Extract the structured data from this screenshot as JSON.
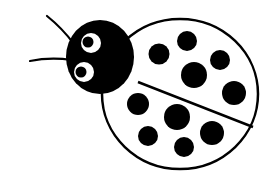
{
  "illustration": {
    "subject": "ladybug",
    "style": "black-and-white clip art",
    "colors": {
      "background": "#ffffff",
      "ink": "#000000",
      "shell_fill": "#ffffff",
      "eye_white": "#ffffff"
    },
    "shell": {
      "cx": 180,
      "cy": 94,
      "rx": 78,
      "ry": 75,
      "stroke_width": 2.5
    },
    "divider": {
      "x1": 138,
      "y1": 82,
      "x2": 253,
      "y2": 127
    },
    "head": {
      "cx": 100,
      "cy": 57,
      "rx": 34,
      "ry": 37
    },
    "eyes": [
      {
        "cx": 91,
        "cy": 43,
        "r": 10,
        "pupil_cx": 88,
        "pupil_cy": 42,
        "pupil_r": 5.5
      },
      {
        "cx": 84,
        "cy": 72,
        "r": 10,
        "pupil_cx": 81,
        "pupil_cy": 72,
        "pupil_r": 5.5
      }
    ],
    "antennae": [
      {
        "d": "M74 44 Q62 28 47 16"
      },
      {
        "d": "M72 60 Q50 57 30 61"
      }
    ],
    "spots": [
      {
        "cx": 159,
        "cy": 54,
        "r": 10.5
      },
      {
        "cx": 187,
        "cy": 41,
        "r": 10
      },
      {
        "cx": 220,
        "cy": 60,
        "r": 10
      },
      {
        "cx": 194,
        "cy": 75,
        "r": 13
      },
      {
        "cx": 234,
        "cy": 93,
        "r": 12
      },
      {
        "cx": 138,
        "cy": 104,
        "r": 11
      },
      {
        "cx": 177,
        "cy": 117,
        "r": 13
      },
      {
        "cx": 148,
        "cy": 136,
        "r": 10
      },
      {
        "cx": 212,
        "cy": 133,
        "r": 12
      },
      {
        "cx": 184,
        "cy": 147,
        "r": 10
      }
    ]
  }
}
